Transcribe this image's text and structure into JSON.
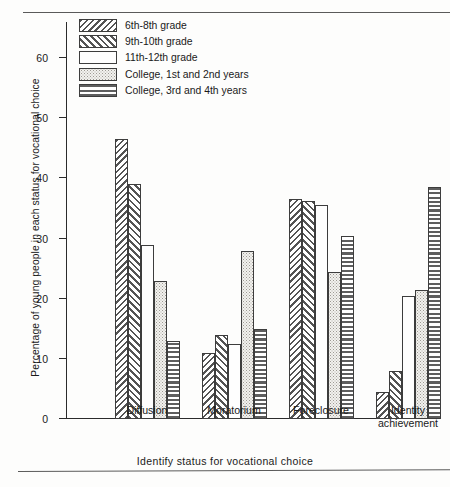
{
  "chart_data": {
    "type": "bar",
    "title": "",
    "xlabel": "Identify status for vocational choice",
    "ylabel": "Percentage of young people in each status for vocational choice",
    "categories": [
      "Diffusion",
      "Moratorium",
      "Foreclosure",
      "Identity\nachievement"
    ],
    "ylim": [
      0,
      66
    ],
    "yticks": [
      0,
      10,
      20,
      30,
      40,
      50,
      60
    ],
    "ytick_labels": [
      "0",
      "10",
      "20",
      "30",
      "40",
      "50",
      "60"
    ],
    "grid": false,
    "legend_position": "top-left",
    "series": [
      {
        "name": "6th-8th grade",
        "pattern": "p-back",
        "values": [
          46.5,
          11.0,
          36.5,
          4.5
        ]
      },
      {
        "name": "9th-10th grade",
        "pattern": "p-fwd",
        "values": [
          39.0,
          14.0,
          36.2,
          8.0
        ]
      },
      {
        "name": "11th-12th grade",
        "pattern": "p-white",
        "values": [
          29.0,
          12.5,
          35.5,
          20.5
        ]
      },
      {
        "name": "College, 1st and 2nd years",
        "pattern": "p-dot",
        "values": [
          23.0,
          28.0,
          24.5,
          21.5
        ]
      },
      {
        "name": "College, 3rd and 4th years",
        "pattern": "p-stripe",
        "values": [
          13.0,
          15.0,
          30.5,
          38.5
        ]
      }
    ]
  }
}
